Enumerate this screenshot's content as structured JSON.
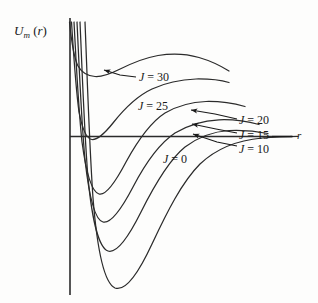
{
  "figure": {
    "axes": {
      "ylabel_main": "U",
      "ylabel_sub": "m",
      "ylabel_arg": "(r)",
      "ylabel_arg_open": "(",
      "ylabel_arg_var": "r",
      "ylabel_arg_close": ")",
      "xlabel": "r"
    },
    "labels": {
      "j30": "J = 30",
      "j25": "J = 25",
      "j20": "J = 20",
      "j15": "J = 15",
      "j10": "J = 10",
      "j0": "J = 0"
    },
    "colors": {
      "ink": "#1a1a1a",
      "curve": "#2b2b2b",
      "background": "#fdfdfc"
    }
  },
  "chart_data": {
    "type": "line",
    "xlabel": "r",
    "ylabel": "U_m (r)",
    "grid": false,
    "legend": "inline-annotations",
    "axis_note": "Horizontal line is U = 0 (the r axis); vertical line is the U axis at small r.",
    "xlim": [
      0,
      1
    ],
    "ylim": [
      -1,
      1
    ],
    "series": [
      {
        "name": "J = 0",
        "J": 0,
        "label": "J = 0",
        "well_depth_rel": -1.0,
        "barrier_height_rel": 0.0,
        "has_barrier": false,
        "points": [
          [
            0.065,
            1.0
          ],
          [
            0.075,
            0.55
          ],
          [
            0.085,
            0.1
          ],
          [
            0.1,
            -0.42
          ],
          [
            0.125,
            -0.78
          ],
          [
            0.155,
            -0.96
          ],
          [
            0.185,
            -1.0
          ],
          [
            0.215,
            -0.95
          ],
          [
            0.26,
            -0.78
          ],
          [
            0.33,
            -0.55
          ],
          [
            0.43,
            -0.33
          ],
          [
            0.55,
            -0.17
          ],
          [
            0.68,
            -0.08
          ],
          [
            0.82,
            -0.03
          ],
          [
            0.95,
            -0.01
          ]
        ]
      },
      {
        "name": "J = 10",
        "J": 10,
        "label": "J = 10",
        "well_depth_rel": -0.78,
        "barrier_height_rel": 0.02,
        "has_barrier": true,
        "points": [
          [
            0.055,
            1.0
          ],
          [
            0.065,
            0.5
          ],
          [
            0.075,
            0.05
          ],
          [
            0.09,
            -0.34
          ],
          [
            0.115,
            -0.64
          ],
          [
            0.145,
            -0.77
          ],
          [
            0.175,
            -0.78
          ],
          [
            0.21,
            -0.71
          ],
          [
            0.26,
            -0.55
          ],
          [
            0.33,
            -0.34
          ],
          [
            0.43,
            -0.15
          ],
          [
            0.54,
            -0.04
          ],
          [
            0.63,
            0.01
          ],
          [
            0.72,
            0.02
          ],
          [
            0.85,
            0.01
          ],
          [
            0.95,
            0.005
          ]
        ]
      },
      {
        "name": "J = 15",
        "J": 15,
        "label": "J = 15",
        "well_depth_rel": -0.58,
        "barrier_height_rel": 0.04,
        "has_barrier": true,
        "points": [
          [
            0.05,
            1.0
          ],
          [
            0.06,
            0.48
          ],
          [
            0.07,
            0.05
          ],
          [
            0.085,
            -0.28
          ],
          [
            0.11,
            -0.49
          ],
          [
            0.14,
            -0.57
          ],
          [
            0.17,
            -0.58
          ],
          [
            0.205,
            -0.52
          ],
          [
            0.255,
            -0.38
          ],
          [
            0.325,
            -0.2
          ],
          [
            0.42,
            -0.04
          ],
          [
            0.52,
            0.03
          ],
          [
            0.62,
            0.05
          ],
          [
            0.73,
            0.04
          ],
          [
            0.86,
            0.02
          ],
          [
            0.95,
            0.01
          ]
        ]
      },
      {
        "name": "J = 20",
        "J": 20,
        "label": "J = 20",
        "well_depth_rel": -0.38,
        "barrier_height_rel": 0.08,
        "has_barrier": true,
        "points": [
          [
            0.045,
            1.0
          ],
          [
            0.055,
            0.46
          ],
          [
            0.067,
            0.06
          ],
          [
            0.082,
            -0.16
          ],
          [
            0.105,
            -0.32
          ],
          [
            0.135,
            -0.38
          ],
          [
            0.165,
            -0.38
          ],
          [
            0.2,
            -0.32
          ],
          [
            0.25,
            -0.19
          ],
          [
            0.32,
            -0.02
          ],
          [
            0.41,
            0.06
          ],
          [
            0.51,
            0.09
          ],
          [
            0.62,
            0.08
          ],
          [
            0.74,
            0.06
          ],
          [
            0.87,
            0.03
          ],
          [
            0.95,
            0.02
          ]
        ]
      },
      {
        "name": "J = 25",
        "J": 25,
        "label": "J = 25",
        "well_depth_rel": -0.06,
        "barrier_height_rel": 0.26,
        "has_barrier": true,
        "points": [
          [
            0.04,
            1.0
          ],
          [
            0.05,
            0.52
          ],
          [
            0.062,
            0.12
          ],
          [
            0.078,
            -0.03
          ],
          [
            0.1,
            -0.07
          ],
          [
            0.125,
            -0.06
          ],
          [
            0.16,
            0.02
          ],
          [
            0.21,
            0.12
          ],
          [
            0.27,
            0.21
          ],
          [
            0.35,
            0.26
          ],
          [
            0.44,
            0.27
          ],
          [
            0.54,
            0.25
          ],
          [
            0.65,
            0.22
          ],
          [
            0.76,
            0.19
          ],
          [
            0.85,
            0.17
          ]
        ]
      },
      {
        "name": "J = 30",
        "J": 30,
        "label": "J = 30",
        "well_depth_rel": 0.32,
        "barrier_height_rel": 0.55,
        "has_barrier": true,
        "points": [
          [
            0.035,
            1.0
          ],
          [
            0.045,
            0.72
          ],
          [
            0.058,
            0.48
          ],
          [
            0.075,
            0.37
          ],
          [
            0.095,
            0.33
          ],
          [
            0.12,
            0.33
          ],
          [
            0.155,
            0.38
          ],
          [
            0.205,
            0.46
          ],
          [
            0.27,
            0.53
          ],
          [
            0.35,
            0.55
          ],
          [
            0.44,
            0.54
          ],
          [
            0.54,
            0.5
          ],
          [
            0.65,
            0.45
          ],
          [
            0.76,
            0.41
          ],
          [
            0.85,
            0.38
          ]
        ]
      }
    ],
    "annotations": [
      {
        "text": "J = 30",
        "target": "local minimum of J=30 curve",
        "arrow": true
      },
      {
        "text": "J = 25",
        "target": "J=25 curve",
        "arrow": false
      },
      {
        "text": "J = 20",
        "target": "J=20 curve barrier top",
        "arrow": true
      },
      {
        "text": "J = 15",
        "target": "J=15 curve barrier top",
        "arrow": true
      },
      {
        "text": "J = 10",
        "target": "J=10 curve barrier top",
        "arrow": true
      },
      {
        "text": "J = 0",
        "target": "J=0 curve tail",
        "arrow": false
      }
    ]
  }
}
